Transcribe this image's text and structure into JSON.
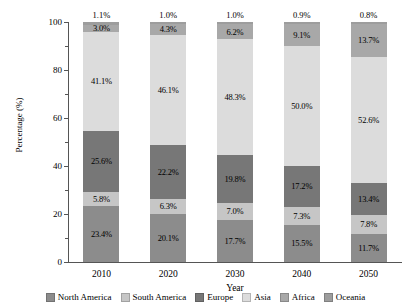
{
  "chart_data": {
    "type": "bar",
    "stacked": true,
    "title": "",
    "xlabel": "Year",
    "ylabel": "Percentage (%)",
    "categories": [
      "2010",
      "2020",
      "2030",
      "2040",
      "2050"
    ],
    "ylim": [
      0,
      100
    ],
    "yticks": [
      0,
      20,
      40,
      60,
      80,
      100
    ],
    "ytick_labels": [
      "0",
      "20",
      "40",
      "60",
      "80",
      "100"
    ],
    "yminor_ticks": [
      10,
      30,
      50,
      70,
      90
    ],
    "grid": false,
    "legend_position": "bottom",
    "series": [
      {
        "name": "North America",
        "color": "#8c8c8c",
        "values": [
          23.4,
          20.1,
          17.7,
          15.5,
          11.7
        ],
        "labels": [
          "23.4%",
          "20.1%",
          "17.7%",
          "15.5%",
          "11.7%"
        ]
      },
      {
        "name": "South America",
        "color": "#c6c6c6",
        "values": [
          5.8,
          6.3,
          7.0,
          7.3,
          7.8
        ],
        "labels": [
          "5.8%",
          "6.3%",
          "7.0%",
          "7.3%",
          "7.8%"
        ]
      },
      {
        "name": "Europe",
        "color": "#777777",
        "values": [
          25.6,
          22.2,
          19.8,
          17.2,
          13.4
        ],
        "labels": [
          "25.6%",
          "22.2%",
          "19.8%",
          "17.2%",
          "13.4%"
        ]
      },
      {
        "name": "Asia",
        "color": "#dcdcdc",
        "values": [
          41.1,
          46.1,
          48.3,
          50.0,
          52.6
        ],
        "labels": [
          "41.1%",
          "46.1%",
          "48.3%",
          "50.0%",
          "52.6%"
        ]
      },
      {
        "name": "Africa",
        "color": "#a8a8a8",
        "values": [
          3.0,
          4.3,
          6.2,
          9.1,
          13.7
        ],
        "labels": [
          "3.0%",
          "4.3%",
          "6.2%",
          "9.1%",
          "13.7%"
        ]
      },
      {
        "name": "Oceania",
        "color": "#9d9d9d",
        "values": [
          1.1,
          1.0,
          1.0,
          0.9,
          0.8
        ],
        "labels": [
          "1.1%",
          "1.0%",
          "1.0%",
          "0.9%",
          "0.8%"
        ]
      }
    ],
    "above_bar_labels": [
      "1.1%",
      "1.0%",
      "1.0%",
      "0.9%",
      "0.8%"
    ]
  }
}
